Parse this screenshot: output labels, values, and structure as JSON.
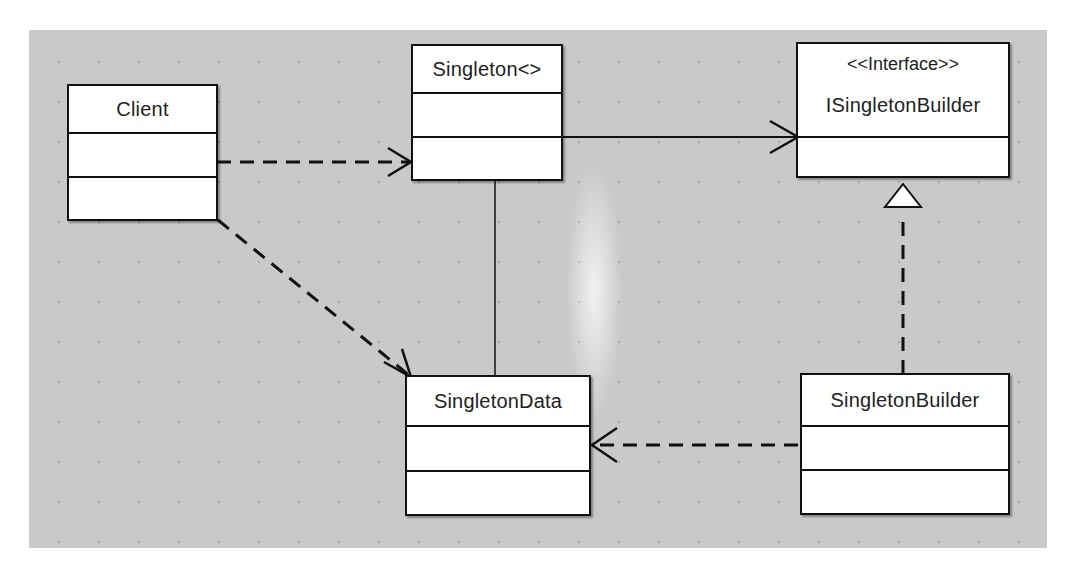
{
  "diagram": {
    "type": "UML class diagram",
    "classes": [
      {
        "id": "client",
        "name": "Client"
      },
      {
        "id": "singleton",
        "name": "Singleton<>"
      },
      {
        "id": "isingletonbuilder",
        "stereotype": "<<Interface>>",
        "name": "ISingletonBuilder"
      },
      {
        "id": "singletondata",
        "name": "SingletonData"
      },
      {
        "id": "singletonbuilder",
        "name": "SingletonBuilder"
      }
    ],
    "relationships": [
      {
        "from": "Client",
        "to": "Singleton<>",
        "kind": "dependency"
      },
      {
        "from": "Client",
        "to": "SingletonData",
        "kind": "dependency"
      },
      {
        "from": "Singleton<>",
        "to": "ISingletonBuilder",
        "kind": "association"
      },
      {
        "from": "Singleton<>",
        "to": "SingletonData",
        "kind": "association"
      },
      {
        "from": "SingletonBuilder",
        "to": "ISingletonBuilder",
        "kind": "realization"
      },
      {
        "from": "SingletonBuilder",
        "to": "SingletonData",
        "kind": "dependency"
      }
    ]
  }
}
